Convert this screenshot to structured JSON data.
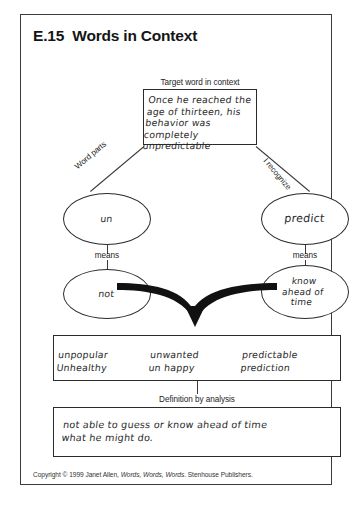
{
  "worksheet": {
    "title": "E.15  Words in Context",
    "copyright_prefix": "Copyright © 1999 Janet Allen, ",
    "copyright_italic": "Words, Words, Words",
    "copyright_suffix": ". Stenhouse Publishers."
  },
  "context": {
    "label": "Target word in context",
    "text": "Once he reached the\nage of thirteen, his\nbehavior was\ncompletely unpredictable"
  },
  "connectors": {
    "left_label": "Word parts",
    "right_label": "I recognize",
    "means_left": "means",
    "means_right": "means"
  },
  "ovals": {
    "word_part_left": "un",
    "word_part_right": "predict",
    "meaning_left": "not",
    "meaning_right": "know\nahead of\ntime"
  },
  "other_words": {
    "label": "Other words I know with these word parts",
    "column1": "unpopular\nUnhealthy",
    "column2": "unwanted\nun happy",
    "column3": "predictable\nprediction"
  },
  "definition": {
    "label": "Definition by analysis",
    "text": "not able to guess or know ahead of time\n   what he might do."
  }
}
